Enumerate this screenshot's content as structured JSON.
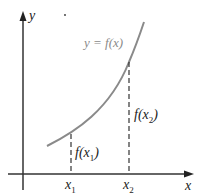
{
  "diagram": {
    "axes": {
      "x_label": "x",
      "y_label": "y"
    },
    "curve": {
      "label": "y = f(x)",
      "color": "#8a8a8a"
    },
    "points": [
      {
        "x_label": "x",
        "x_sub": "1",
        "value_label": "f(x",
        "value_sub": "1",
        "value_close": ")"
      },
      {
        "x_label": "x",
        "x_sub": "2",
        "value_label": "f(x",
        "value_sub": "2",
        "value_close": ")"
      }
    ]
  }
}
